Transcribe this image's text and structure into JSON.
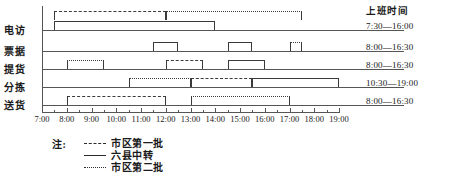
{
  "chart_data": {
    "type": "bar",
    "title": "",
    "xlabel": "",
    "ylabel": "",
    "x_axis": {
      "start": "7:00",
      "end": "19:00",
      "tick_labels": [
        "7:00",
        "8:00",
        "9:00",
        "10:00",
        "11:00",
        "12:00",
        "13:00",
        "14:00",
        "15:00",
        "16:00",
        "17:00",
        "18:00",
        "19:00"
      ],
      "minor_tick_interval_minutes": 30,
      "grid": false
    },
    "categories": [
      "电访",
      "票据",
      "提货",
      "分拣",
      "送货"
    ],
    "series": [
      {
        "name": "市区第一批",
        "style": "dashed"
      },
      {
        "name": "六县中转",
        "style": "solid"
      },
      {
        "name": "市区第二批",
        "style": "dotted"
      }
    ],
    "tasks": [
      {
        "row": "电访",
        "series": "六县中转",
        "style": "solid",
        "start": "7:30",
        "end": "14:00",
        "lane": 0
      },
      {
        "row": "电访",
        "series": "市区第一批",
        "style": "dashed",
        "start": "7:30",
        "end": "12:00",
        "lane": 1
      },
      {
        "row": "电访",
        "series": "市区第二批",
        "style": "dotted",
        "start": "12:00",
        "end": "17:30",
        "lane": 1
      },
      {
        "row": "票据",
        "series": "六县中转",
        "style": "solid",
        "start": "11:30",
        "end": "12:30",
        "lane": 0
      },
      {
        "row": "票据",
        "series": "六县中转",
        "style": "solid",
        "start": "14:30",
        "end": "15:30",
        "lane": 0
      },
      {
        "row": "票据",
        "series": "市区第二批",
        "style": "dotted",
        "start": "17:00",
        "end": "17:30",
        "lane": 0
      },
      {
        "row": "提货",
        "series": "市区第二批",
        "style": "dotted",
        "start": "8:00",
        "end": "9:30",
        "lane": 0
      },
      {
        "row": "提货",
        "series": "市区第一批",
        "style": "dashed",
        "start": "12:00",
        "end": "13:30",
        "lane": 0
      },
      {
        "row": "提货",
        "series": "六县中转",
        "style": "solid",
        "start": "14:30",
        "end": "16:00",
        "lane": 0
      },
      {
        "row": "分拣",
        "series": "市区第二批",
        "style": "dotted",
        "start": "10:30",
        "end": "13:00",
        "lane": 0
      },
      {
        "row": "分拣",
        "series": "市区第一批",
        "style": "dashed",
        "start": "13:00",
        "end": "15:30",
        "lane": 0
      },
      {
        "row": "分拣",
        "series": "六县中转",
        "style": "solid",
        "start": "15:30",
        "end": "19:00",
        "lane": 0
      },
      {
        "row": "送货",
        "series": "市区第一批",
        "style": "dashed",
        "start": "8:00",
        "end": "12:00",
        "lane": 0
      },
      {
        "row": "送货",
        "series": "市区第二批",
        "style": "dotted",
        "start": "13:00",
        "end": "17:00",
        "lane": 0
      }
    ]
  },
  "rows": [
    {
      "label": "电访",
      "shift": "7:30—16:00"
    },
    {
      "label": "票据",
      "shift": "8:00—16:30"
    },
    {
      "label": "提货",
      "shift": "8:00—16:30"
    },
    {
      "label": "分拣",
      "shift": "10:30—19:00"
    },
    {
      "label": "送货",
      "shift": "8:00—16:30"
    }
  ],
  "shift_column": {
    "header": "上班时间"
  },
  "legend": {
    "note_label": "注:",
    "entries": [
      {
        "style": "dashed",
        "label": "市区第一批"
      },
      {
        "style": "solid",
        "label": "六县中转"
      },
      {
        "style": "dotted",
        "label": "市区第二批"
      }
    ]
  }
}
